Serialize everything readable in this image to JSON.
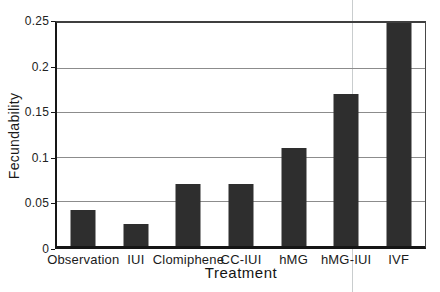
{
  "figure": {
    "background_color": "#ffffff",
    "bar_color": "#2e2e2e",
    "gridline_color": "#8c8c8c",
    "axis_color": "#161616",
    "frame_color": "#3f3f3f",
    "text_color": "#1a1a1a",
    "scan_line_color": "#c9cdce",
    "scan_line_x": 352
  },
  "chart_data": {
    "type": "bar",
    "title": "",
    "xlabel": "Treatment",
    "ylabel": "Fecundability",
    "categories": [
      "Observation",
      "IUI",
      "Clomiphene",
      "CC-IUI",
      "hMG",
      "hMG-IUI",
      "IVF"
    ],
    "values": [
      0.04,
      0.025,
      0.07,
      0.07,
      0.11,
      0.17,
      0.25
    ],
    "ylim": [
      0,
      0.25
    ],
    "yticks": [
      0,
      0.05,
      0.1,
      0.15,
      0.2,
      0.25
    ],
    "ytick_labels": [
      "0",
      "0.05",
      "0.1",
      "0.15",
      "0.2",
      "0.25"
    ],
    "grid": "horizontal",
    "legend": "none",
    "bar_width_px": 25
  }
}
